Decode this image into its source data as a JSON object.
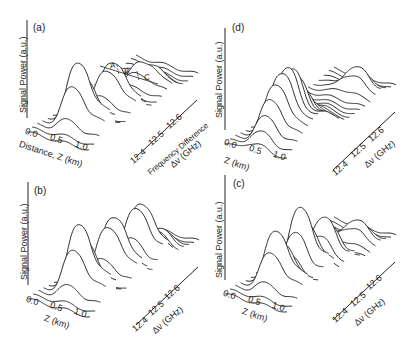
{
  "chart_data": [
    {
      "type": "waterfall-3d",
      "panel": "(a)",
      "ylabel": "Signal Power (a.u.)",
      "xlabel": "Distance, Z (km)",
      "zlabel": "Frequency Difference Δν (GHz)",
      "x_ticks": [
        "0.0",
        "0.5",
        "1.0"
      ],
      "z_ticks": [
        "12.4",
        "12.5",
        "12.6"
      ],
      "annotations": [
        "A",
        "B",
        "C"
      ],
      "peaks": [
        {
          "region": "A",
          "freq_ghz": 12.43,
          "z_km": 0.6,
          "height": 0.85
        },
        {
          "region": "B",
          "freq_ghz": 12.5,
          "z_km": 0.7,
          "height": 0.6
        },
        {
          "region": "C",
          "freq_ghz": 12.58,
          "z_km": 0.7,
          "height": 0.3
        }
      ]
    },
    {
      "type": "waterfall-3d",
      "panel": "(b)",
      "ylabel": "Signal Power (a.u.)",
      "xlabel": "Z (km)",
      "zlabel": "Δν (GHz)",
      "x_ticks": [
        "0.0",
        "0.5",
        "1.0"
      ],
      "z_ticks": [
        "12.4",
        "12.5",
        "12.6"
      ],
      "peaks": [
        {
          "freq_ghz": 12.43,
          "z_km": 0.6,
          "height": 0.9
        },
        {
          "freq_ghz": 12.5,
          "z_km": 0.7,
          "height": 0.75
        },
        {
          "freq_ghz": 12.56,
          "z_km": 0.75,
          "height": 0.7
        },
        {
          "freq_ghz": 12.6,
          "z_km": 0.8,
          "height": 0.2
        }
      ]
    },
    {
      "type": "waterfall-3d",
      "panel": "(c)",
      "ylabel": "Signal Power (a.u.)",
      "xlabel": "Z (km)",
      "zlabel": "Δν (GHz)",
      "x_ticks": [
        "0.0",
        "0.5",
        "1.0"
      ],
      "z_ticks": [
        "12.4",
        "12.5",
        "12.6"
      ],
      "peaks": [
        {
          "freq_ghz": 12.43,
          "z_km": 0.6,
          "height": 0.75
        },
        {
          "freq_ghz": 12.48,
          "z_km": 0.7,
          "height": 0.85
        },
        {
          "freq_ghz": 12.53,
          "z_km": 0.75,
          "height": 0.55
        },
        {
          "freq_ghz": 12.6,
          "z_km": 0.8,
          "height": 0.25
        }
      ]
    },
    {
      "type": "waterfall-3d",
      "panel": "(d)",
      "ylabel": "Signal Power (a.u.)",
      "xlabel": "Z (km)",
      "zlabel": "Δν (GHz)",
      "x_ticks": [
        "0.0",
        "0.5",
        "1.0"
      ],
      "z_ticks": [
        "12.4",
        "12.5",
        "12.6"
      ],
      "peaks": [
        {
          "freq_ghz": 12.45,
          "z_km": 0.6,
          "height": 0.85,
          "width": "broad"
        },
        {
          "freq_ghz": 12.6,
          "z_km": 0.8,
          "height": 0.3
        }
      ]
    }
  ],
  "panels": {
    "a": {
      "label": "(a)",
      "ylabel": "Signal Power (a.u.)",
      "xlabel": "Distance, Z (km)",
      "zlabel1": "Frequency Difference",
      "zlabel2": "Δν (GHz)",
      "x0": "0.0",
      "x1": "0.5",
      "x2": "1.0",
      "f0": "12.4",
      "f1": "12.5",
      "f2": "12.6",
      "A": "A",
      "B": "B",
      "C": "C"
    },
    "b": {
      "label": "(b)",
      "ylabel": "Signal Power (a.u.)",
      "xlabel": "Z (km)",
      "zlabel2": "Δν (GHz)",
      "x0": "0.0",
      "x1": "0.5",
      "x2": "1.0",
      "f0": "12.4",
      "f1": "12.5",
      "f2": "12.6"
    },
    "c": {
      "label": "(c)",
      "ylabel": "Signal Power (a.u.)",
      "xlabel": "Z (km)",
      "zlabel2": "Δν (GHz)",
      "x0": "0.0",
      "x1": "0.5",
      "x2": "1.0",
      "f0": "12.4",
      "f1": "12.5",
      "f2": "12.6"
    },
    "d": {
      "label": "(d)",
      "ylabel": "Signal Power (a.u.)",
      "xlabel": "Z (km)",
      "zlabel2": "Δν (GHz)",
      "x0": "0.0",
      "x1": "0.5",
      "x2": "1.0",
      "f0": "12.4",
      "f1": "12.5",
      "f2": "12.6"
    }
  }
}
